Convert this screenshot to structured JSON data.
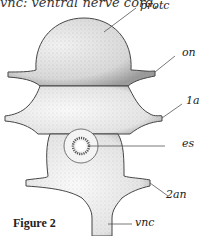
{
  "caption_fragment": "vnc: ventral nerve cord,",
  "figure": {
    "title": "Figure 2",
    "labels": {
      "protc": "protc",
      "on": "on",
      "1an": "1an",
      "es": "es",
      "2an": "2an",
      "vnc": "vnc"
    }
  }
}
